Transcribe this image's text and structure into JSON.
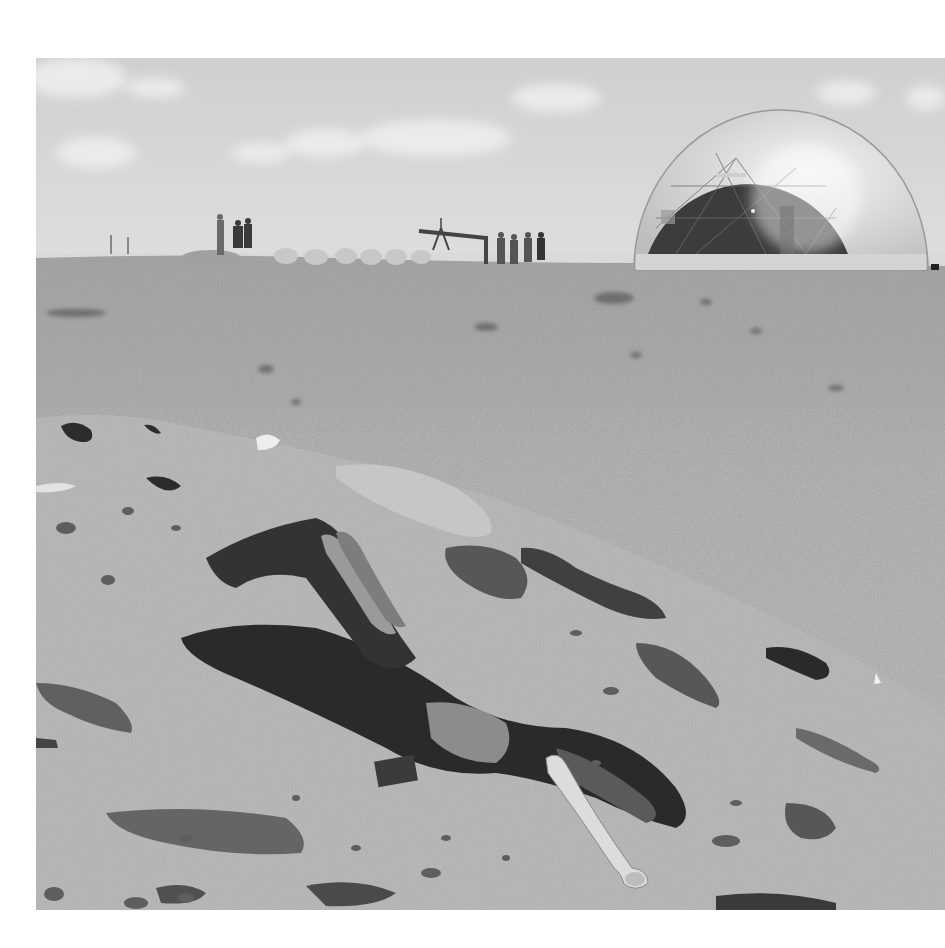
{
  "image": {
    "type": "black-and-white photograph",
    "description": "Desert/beach sand slope with decaying animal carcass and bones in foreground; people and a geodesic dome on the horizon",
    "colors": {
      "sky": "#d2d2d2",
      "cloud": "#eeeeee",
      "sand_far": "#a9a9a9",
      "sand_near": "#b5b5b5",
      "rock": "#5a5a5a",
      "carcass": "#2a2a2a",
      "bone": "#dcdcdc",
      "dome_shell": "#e4e4e4",
      "dome_interior": "#3c3c3c"
    },
    "elements": {
      "dome": "geodesic-dome",
      "people_left_count": 3,
      "people_right_count": 5,
      "structure": "tripod-beam"
    }
  }
}
